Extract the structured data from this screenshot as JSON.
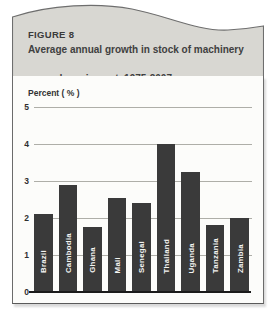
{
  "figure": {
    "label": "FIGURE 8",
    "title_line1": "Average annual growth in stock of machinery",
    "title_line2": "and  equipment, 1975-2007"
  },
  "chart_data": {
    "type": "bar",
    "title": "Average annual growth in stock of machinery and equipment, 1975-2007",
    "xlabel": "",
    "ylabel": "Percent ( % )",
    "categories": [
      "Brazil",
      "Cambodia",
      "Ghana",
      "Mali",
      "Senegal",
      "Thailand",
      "Uganda",
      "Tanzania",
      "Zambia"
    ],
    "values": [
      2.1,
      2.9,
      1.75,
      2.55,
      2.4,
      4.0,
      3.25,
      1.8,
      2.0
    ],
    "yticks": [
      5,
      4,
      3,
      2,
      1,
      0
    ],
    "ylim": [
      0,
      5
    ],
    "grid": "horizontal",
    "legend_position": "none",
    "bar_label_placement": "inside-bottom-rotated"
  },
  "colors": {
    "header_bg": "#d8d7d2",
    "header_curve_stroke": "#6e6e6e",
    "separator_bar": "#2c2c2c",
    "title_text": "#404040",
    "chart_bg": "#fcfcfa",
    "bar_fill": "#3a3a3a",
    "bar_label_text": "#f4f4f2",
    "gridline": "#aeaea8",
    "axis_line": "#1b1b1b"
  }
}
